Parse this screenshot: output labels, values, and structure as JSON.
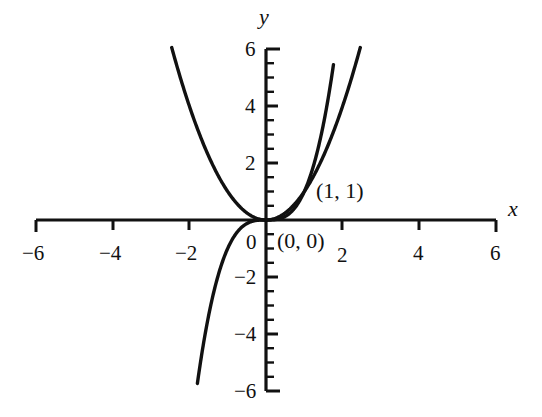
{
  "chart_data": {
    "type": "line",
    "title": "",
    "xlabel": "x",
    "ylabel": "y",
    "xlim": [
      -6,
      6
    ],
    "ylim": [
      -6,
      6
    ],
    "grid": false,
    "legend": "none",
    "background_color": "#ffffff",
    "curve_color": "#111111",
    "axis_color": "#111111",
    "x_ticks": [
      -6,
      -4,
      -2,
      2,
      4,
      6
    ],
    "x_tick_labels": [
      "−6",
      "−4",
      "−2",
      "2",
      "4",
      "6"
    ],
    "y_ticks": [
      -6,
      -4,
      -2,
      0,
      2,
      4,
      6
    ],
    "y_tick_labels": [
      "−6",
      "−4",
      "−2",
      "0",
      "2",
      "4",
      "6"
    ],
    "y_minor_tick_step": 0.5,
    "x_minor_ticks": false,
    "series": [
      {
        "name": "y = x^2",
        "equation": "y = x * x",
        "x_domain": [
          -2.46,
          2.46
        ],
        "values": [
          {
            "x": -2.46,
            "y": 6.05
          },
          {
            "x": -2.2,
            "y": 4.84
          },
          {
            "x": -2.0,
            "y": 4.0
          },
          {
            "x": -1.75,
            "y": 3.06
          },
          {
            "x": -1.5,
            "y": 2.25
          },
          {
            "x": -1.25,
            "y": 1.56
          },
          {
            "x": -1.0,
            "y": 1.0
          },
          {
            "x": -0.75,
            "y": 0.56
          },
          {
            "x": -0.5,
            "y": 0.25
          },
          {
            "x": -0.25,
            "y": 0.06
          },
          {
            "x": 0.0,
            "y": 0.0
          },
          {
            "x": 0.25,
            "y": 0.06
          },
          {
            "x": 0.5,
            "y": 0.25
          },
          {
            "x": 0.75,
            "y": 0.56
          },
          {
            "x": 1.0,
            "y": 1.0
          },
          {
            "x": 1.25,
            "y": 1.56
          },
          {
            "x": 1.5,
            "y": 2.25
          },
          {
            "x": 1.75,
            "y": 3.06
          },
          {
            "x": 2.0,
            "y": 4.0
          },
          {
            "x": 2.2,
            "y": 4.84
          },
          {
            "x": 2.46,
            "y": 6.05
          }
        ]
      },
      {
        "name": "y = x^3",
        "equation": "y = x * x * x",
        "x_domain": [
          -1.79,
          1.76
        ],
        "values": [
          {
            "x": -1.79,
            "y": -5.74
          },
          {
            "x": -1.6,
            "y": -4.1
          },
          {
            "x": -1.4,
            "y": -2.74
          },
          {
            "x": -1.2,
            "y": -1.73
          },
          {
            "x": -1.0,
            "y": -1.0
          },
          {
            "x": -0.8,
            "y": -0.51
          },
          {
            "x": -0.6,
            "y": -0.22
          },
          {
            "x": -0.4,
            "y": -0.06
          },
          {
            "x": -0.2,
            "y": -0.01
          },
          {
            "x": 0.0,
            "y": 0.0
          },
          {
            "x": 0.2,
            "y": 0.01
          },
          {
            "x": 0.4,
            "y": 0.06
          },
          {
            "x": 0.6,
            "y": 0.22
          },
          {
            "x": 0.8,
            "y": 0.51
          },
          {
            "x": 1.0,
            "y": 1.0
          },
          {
            "x": 1.2,
            "y": 1.73
          },
          {
            "x": 1.4,
            "y": 2.74
          },
          {
            "x": 1.6,
            "y": 4.1
          },
          {
            "x": 1.76,
            "y": 5.45
          }
        ]
      }
    ],
    "annotations": [
      {
        "label": "(1, 1)",
        "x": 1,
        "y": 1
      },
      {
        "label": "(0, 0)",
        "x": 0,
        "y": 0
      }
    ]
  },
  "axes": {
    "x_name": "x",
    "y_name": "y"
  },
  "tick_labels": {
    "x": {
      "neg6": "−6",
      "neg4": "−4",
      "neg2": "−2",
      "pos2": "2",
      "pos4": "4",
      "pos6": "6"
    },
    "y": {
      "pos6": "6",
      "pos4": "4",
      "pos2": "2",
      "zero": "0",
      "neg2": "−2",
      "neg4": "−4",
      "neg6": "−6"
    }
  },
  "annotations": {
    "origin_point": "(0, 0)",
    "unit_point": "(1, 1)"
  }
}
